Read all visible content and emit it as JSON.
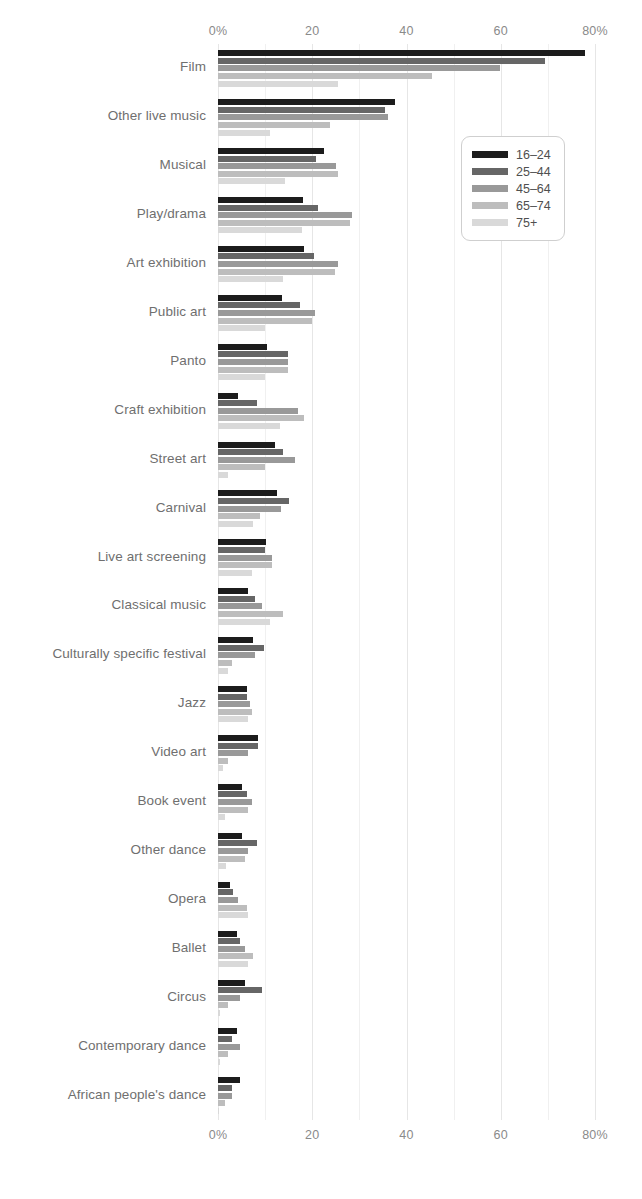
{
  "chart_data": {
    "type": "bar",
    "orientation": "horizontal",
    "title": "",
    "subtitle": "",
    "xlabel": "",
    "ylabel": "",
    "xlim": [
      0,
      80
    ],
    "xticks": [
      0,
      20,
      40,
      60,
      80
    ],
    "xtick_labels": [
      "0%",
      "20",
      "40",
      "60",
      "80%"
    ],
    "grid": true,
    "grid_axis": "x",
    "axis_positions": [
      "top",
      "bottom"
    ],
    "legend": {
      "position": "top-right-inside",
      "entries": [
        "16–24",
        "25–44",
        "45–64",
        "65–74",
        "75+"
      ]
    },
    "series": [
      {
        "name": "16–24",
        "color": "#1c1c1c",
        "values": [
          77.8,
          37.5,
          22.5,
          18.0,
          18.2,
          13.5,
          10.4,
          4.2,
          12.0,
          12.5,
          10.2,
          6.4,
          7.4,
          6.2,
          8.5,
          5.1,
          5.1,
          2.5,
          4.0,
          5.7,
          4.0,
          4.6
        ]
      },
      {
        "name": "25–44",
        "color": "#666666",
        "values": [
          69.4,
          35.4,
          20.8,
          21.2,
          20.4,
          17.4,
          14.8,
          8.3,
          13.8,
          15.0,
          10.0,
          7.9,
          9.8,
          6.2,
          8.5,
          6.2,
          8.3,
          3.2,
          4.7,
          9.4,
          3.0,
          3.0
        ]
      },
      {
        "name": "45–64",
        "color": "#999999",
        "values": [
          59.9,
          36.1,
          25.0,
          28.4,
          25.5,
          20.6,
          14.8,
          17.0,
          16.4,
          13.4,
          11.5,
          9.4,
          7.9,
          6.8,
          6.4,
          7.2,
          6.4,
          4.2,
          5.7,
          4.7,
          4.7,
          3.0
        ]
      },
      {
        "name": "65–74",
        "color": "#bdbdbd",
        "values": [
          45.4,
          23.8,
          25.5,
          28.0,
          24.8,
          20.0,
          14.8,
          18.3,
          10.0,
          8.9,
          11.5,
          13.8,
          3.0,
          7.2,
          2.1,
          6.4,
          5.7,
          6.2,
          7.4,
          2.1,
          2.1,
          1.5
        ]
      },
      {
        "name": "75+",
        "color": "#d9d9d9",
        "values": [
          25.5,
          11.0,
          14.2,
          17.8,
          13.8,
          10.0,
          10.0,
          13.2,
          2.1,
          7.4,
          7.2,
          11.0,
          2.1,
          6.4,
          1.1,
          1.5,
          1.7,
          6.4,
          6.4,
          0.5,
          0.5,
          0.2
        ]
      }
    ],
    "categories": [
      "Film",
      "Other live music",
      "Musical",
      "Play/drama",
      "Art exhibition",
      "Public art",
      "Panto",
      "Craft exhibition",
      "Street art",
      "Carnival",
      "Live art screening",
      "Classical music",
      "Culturally specific festival",
      "Jazz",
      "Video art",
      "Book event",
      "Other dance",
      "Opera",
      "Ballet",
      "Circus",
      "Contemporary dance",
      "African people's dance"
    ]
  },
  "colors": {
    "background": "#ffffff",
    "gridline": "#e6e6e6",
    "tick_text": "#8a8a8a",
    "category_text": "#6f6f6f",
    "legend_border": "#cfcfcf",
    "legend_text": "#4f4f4f"
  }
}
